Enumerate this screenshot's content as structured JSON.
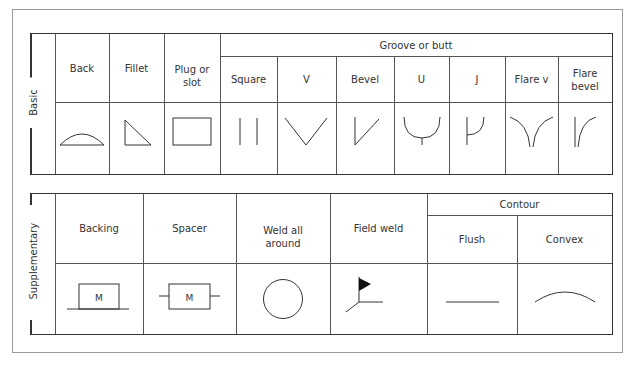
{
  "diagram": {
    "basic": {
      "section_label": "Basic",
      "group_header": "Groove or butt",
      "columns": [
        {
          "label": "Back",
          "icon": "back-weld-arc-icon"
        },
        {
          "label": "Fillet",
          "icon": "fillet-triangle-icon"
        },
        {
          "label": "Plug or slot",
          "icon": "plug-slot-rectangle-icon"
        },
        {
          "label": "Square",
          "icon": "square-groove-icon"
        },
        {
          "label": "V",
          "icon": "v-groove-icon"
        },
        {
          "label": "Bevel",
          "icon": "bevel-groove-icon"
        },
        {
          "label": "U",
          "icon": "u-groove-icon"
        },
        {
          "label": "J",
          "icon": "j-groove-icon"
        },
        {
          "label": "Flare v",
          "icon": "flare-v-groove-icon"
        },
        {
          "label": "Flare bevel",
          "icon": "flare-bevel-groove-icon"
        }
      ]
    },
    "supplementary": {
      "section_label": "Supplementary",
      "group_header": "Contour",
      "columns": [
        {
          "label": "Backing",
          "icon": "backing-m-box-icon",
          "symbol_text": "M"
        },
        {
          "label": "Spacer",
          "icon": "spacer-m-box-icon",
          "symbol_text": "M"
        },
        {
          "label": "Weld all around",
          "icon": "weld-all-around-circle-icon"
        },
        {
          "label": "Field weld",
          "icon": "field-weld-flag-icon"
        },
        {
          "label": "Flush",
          "icon": "flush-line-icon"
        },
        {
          "label": "Convex",
          "icon": "convex-arc-icon"
        }
      ]
    },
    "colors": {
      "line": "#333333",
      "text": "#333333",
      "frame": "#9a9a9a"
    }
  }
}
